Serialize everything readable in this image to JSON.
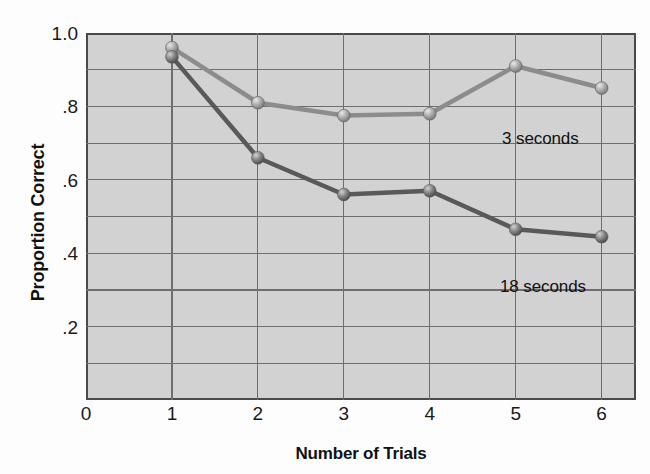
{
  "chart_data": {
    "type": "line",
    "title": "",
    "xlabel": "Number of Trials",
    "ylabel": "Proportion Correct",
    "x": [
      1,
      2,
      3,
      4,
      5,
      6
    ],
    "xlim": [
      0,
      6.4
    ],
    "ylim": [
      0,
      1.0
    ],
    "grid": true,
    "legend_position": "inline-annotation",
    "xticks": [
      "0",
      "1",
      "2",
      "3",
      "4",
      "5",
      "6"
    ],
    "xtick_values": [
      0,
      1,
      2,
      3,
      4,
      5,
      6
    ],
    "yticks": [
      "1.0",
      ".8",
      ".6",
      ".4",
      ".2"
    ],
    "ytick_values": [
      1.0,
      0.8,
      0.6,
      0.4,
      0.2
    ],
    "series": [
      {
        "name": "3 seconds",
        "label": "3 seconds",
        "color": "#8c8c8c",
        "values": [
          0.96,
          0.81,
          0.775,
          0.78,
          0.91,
          0.85
        ]
      },
      {
        "name": "18 seconds",
        "label": "18 seconds",
        "color": "#595959",
        "values": [
          0.935,
          0.66,
          0.56,
          0.57,
          0.465,
          0.445
        ]
      }
    ],
    "plot_background": "#d2d2d2",
    "grid_color": "#6e6e6e",
    "axis_color": "#4a4a4a"
  }
}
